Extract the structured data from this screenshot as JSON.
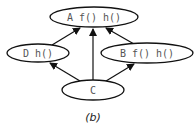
{
  "diagram": {
    "type": "class-hierarchy-graph",
    "caption": "(b)",
    "nodes": [
      {
        "id": "A",
        "label": "A f() h()",
        "cx": 94,
        "cy": 17,
        "rx": 44,
        "ry": 10
      },
      {
        "id": "D",
        "label": "D h()",
        "cx": 38,
        "cy": 53,
        "rx": 31,
        "ry": 9
      },
      {
        "id": "B",
        "label": "B f() h()",
        "cx": 147,
        "cy": 53,
        "rx": 46,
        "ry": 10
      },
      {
        "id": "C",
        "label": "C",
        "cx": 93,
        "cy": 90,
        "rx": 31,
        "ry": 10
      }
    ],
    "edges": [
      {
        "from": "D",
        "to": "A"
      },
      {
        "from": "C",
        "to": "A"
      },
      {
        "from": "B",
        "to": "A"
      },
      {
        "from": "C",
        "to": "D"
      },
      {
        "from": "C",
        "to": "B"
      }
    ],
    "colors": {
      "stroke": "#111111",
      "text": "#555555",
      "background": "#ffffff"
    }
  }
}
